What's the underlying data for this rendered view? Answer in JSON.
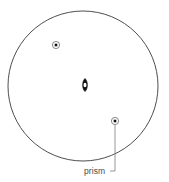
{
  "figure": {
    "type": "survey-setup-diagram",
    "background_color": "#ffffff",
    "outline_color": "#3a3a3a",
    "marker_color": "#111111",
    "leader_color": "#808080",
    "label_color": "#4a4a4a"
  },
  "boundary": {
    "name": "circular boundary",
    "shape": "circle",
    "center_x": 83,
    "center_y": 86,
    "radius": 75,
    "stroke_width": 0.9
  },
  "markers": [
    {
      "id": "prism-upper-left",
      "kind": "prism",
      "symbol": "dot-in-circle",
      "x": 56,
      "y": 45,
      "outer_radius": 3.6,
      "inner_size": 2.6,
      "label": ""
    },
    {
      "id": "instrument-center",
      "kind": "instrument",
      "symbol": "vertical-lens",
      "x": 85,
      "y": 85,
      "width": 5.6,
      "height": 13,
      "label": ""
    },
    {
      "id": "prism-lower-right",
      "kind": "prism",
      "symbol": "dot-in-circle",
      "x": 115,
      "y": 121,
      "outer_radius": 3.6,
      "inner_size": 2.6,
      "label": "prism"
    }
  ],
  "leader": {
    "name": "prism-leader-line",
    "from_x": 115,
    "from_y": 125,
    "corner_x": 115,
    "corner_y": 171,
    "to_x": 110,
    "to_y": 171,
    "stroke_width": 0.9
  },
  "labels": {
    "prism": {
      "text": "prism",
      "x": 84,
      "y": 174,
      "anchor": "start",
      "font_size": 8.5
    }
  }
}
